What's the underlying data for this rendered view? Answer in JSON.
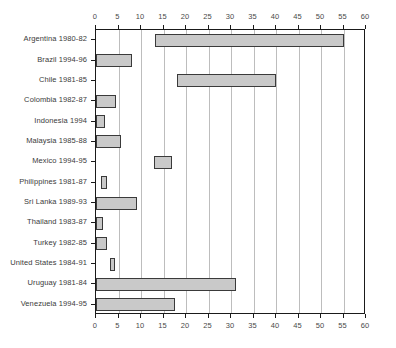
{
  "chart_data": {
    "type": "bar",
    "orientation": "horizontal",
    "title": "",
    "subtitle": "",
    "xlabel": "",
    "ylabel": "",
    "xlim": [
      0,
      60
    ],
    "xticks": [
      0,
      5,
      10,
      15,
      20,
      25,
      30,
      35,
      40,
      45,
      50,
      55,
      60
    ],
    "xtick_labels": [
      "0",
      "5",
      "10",
      "15",
      "20",
      "25",
      "30",
      "35",
      "40",
      "45",
      "50",
      "55",
      "60"
    ],
    "axis_positions": [
      "top",
      "bottom"
    ],
    "grid": true,
    "grid_axis": "x",
    "legend": false,
    "legend_position": "none",
    "bar_style": "range",
    "categories": [
      "Argentina 1980-82",
      "Brazil 1994-96",
      "Chile 1981-85",
      "Colombia 1982-87",
      "Indonesia 1994",
      "Malaysia 1985-88",
      "Mexico 1994-95",
      "Philippines 1981-87",
      "Sri Lanka 1989-93",
      "Thailand 1983-87",
      "Turkey 1982-85",
      "United States 1984-91",
      "Uruguay 1981-84",
      "Venezuela 1994-95"
    ],
    "ranges": [
      {
        "category": "Argentina 1980-82",
        "start": 13.0,
        "end": 55.0
      },
      {
        "category": "Brazil 1994-96",
        "start": 0.0,
        "end": 8.0
      },
      {
        "category": "Chile 1981-85",
        "start": 18.0,
        "end": 40.0
      },
      {
        "category": "Colombia 1982-87",
        "start": 0.0,
        "end": 4.5
      },
      {
        "category": "Indonesia 1994",
        "start": 0.0,
        "end": 2.0
      },
      {
        "category": "Malaysia 1985-88",
        "start": 0.0,
        "end": 5.5
      },
      {
        "category": "Mexico 1994-95",
        "start": 12.8,
        "end": 16.8
      },
      {
        "category": "Philippines 1981-87",
        "start": 1.0,
        "end": 2.5
      },
      {
        "category": "Sri Lanka 1989-93",
        "start": 0.0,
        "end": 9.0
      },
      {
        "category": "Thailand 1983-87",
        "start": 0.0,
        "end": 1.5
      },
      {
        "category": "Turkey 1982-85",
        "start": 0.0,
        "end": 2.5
      },
      {
        "category": "United States 1984-91",
        "start": 3.0,
        "end": 4.2
      },
      {
        "category": "Uruguay 1981-84",
        "start": 0.0,
        "end": 31.0
      },
      {
        "category": "Venezuela 1994-95",
        "start": 0.0,
        "end": 17.5
      }
    ],
    "colors": {
      "bar_fill": "#c9c9c9",
      "bar_border": "#3a3a3a",
      "grid": "#bdbdbd",
      "axis": "#1a1a1a",
      "text": "#3a3a3a",
      "background": "#ffffff"
    }
  },
  "layout": {
    "plot_left": 95,
    "plot_top": 29,
    "plot_width": 270,
    "plot_height": 285
  }
}
